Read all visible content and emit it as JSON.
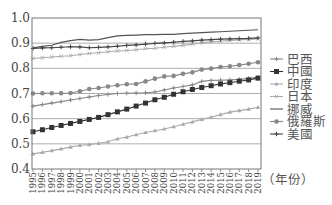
{
  "chart_data": {
    "type": "line",
    "title": "",
    "xlabel": "（年份）",
    "ylabel": "",
    "ylim": [
      0.4,
      1.0
    ],
    "yticks": [
      "0.4",
      "0.5",
      "0.6",
      "0.7",
      "0.8",
      "0.9",
      "1.0"
    ],
    "grid": "horizontal",
    "legend_position": "right",
    "x": [
      1995,
      1996,
      1997,
      1998,
      1999,
      2000,
      2001,
      2002,
      2003,
      2004,
      2005,
      2006,
      2007,
      2008,
      2009,
      2010,
      2011,
      2012,
      2013,
      2014,
      2015,
      2016,
      2017,
      2018,
      2019
    ],
    "series": [
      {
        "name": "巴西",
        "marker": "plus",
        "color": "#888888",
        "values": [
          0.65,
          0.656,
          0.662,
          0.668,
          0.674,
          0.68,
          0.686,
          0.692,
          0.696,
          0.7,
          0.701,
          0.702,
          0.703,
          0.706,
          0.714,
          0.722,
          0.728,
          0.734,
          0.748,
          0.752,
          0.753,
          0.754,
          0.756,
          0.76,
          0.765
        ]
      },
      {
        "name": "中國",
        "marker": "square",
        "color": "#333333",
        "values": [
          0.548,
          0.556,
          0.565,
          0.573,
          0.581,
          0.589,
          0.597,
          0.605,
          0.616,
          0.627,
          0.638,
          0.65,
          0.662,
          0.675,
          0.685,
          0.697,
          0.707,
          0.716,
          0.724,
          0.731,
          0.738,
          0.743,
          0.749,
          0.754,
          0.761
        ]
      },
      {
        "name": "印度",
        "marker": "triangle",
        "color": "#aaaaaa",
        "values": [
          0.46,
          0.466,
          0.473,
          0.48,
          0.487,
          0.494,
          0.497,
          0.502,
          0.508,
          0.52,
          0.527,
          0.536,
          0.545,
          0.552,
          0.559,
          0.568,
          0.578,
          0.587,
          0.597,
          0.606,
          0.616,
          0.626,
          0.632,
          0.638,
          0.645
        ]
      },
      {
        "name": "日本",
        "marker": "x",
        "color": "#aaaaaa",
        "values": [
          0.839,
          0.842,
          0.845,
          0.848,
          0.85,
          0.855,
          0.859,
          0.862,
          0.866,
          0.869,
          0.871,
          0.874,
          0.878,
          0.88,
          0.884,
          0.888,
          0.891,
          0.896,
          0.901,
          0.905,
          0.908,
          0.911,
          0.913,
          0.915,
          0.917
        ]
      },
      {
        "name": "挪威",
        "marker": "none",
        "color": "#555555",
        "values": [
          0.881,
          0.887,
          0.892,
          0.903,
          0.91,
          0.915,
          0.912,
          0.914,
          0.922,
          0.929,
          0.931,
          0.932,
          0.934,
          0.934,
          0.935,
          0.935,
          0.938,
          0.94,
          0.942,
          0.944,
          0.945,
          0.947,
          0.949,
          0.951,
          0.953
        ]
      },
      {
        "name": "俄羅斯",
        "marker": "circle",
        "color": "#888888",
        "values": [
          0.7,
          0.701,
          0.701,
          0.701,
          0.702,
          0.709,
          0.718,
          0.722,
          0.728,
          0.733,
          0.737,
          0.738,
          0.748,
          0.759,
          0.768,
          0.77,
          0.778,
          0.784,
          0.795,
          0.799,
          0.805,
          0.808,
          0.813,
          0.818,
          0.824
        ]
      },
      {
        "name": "美國",
        "marker": "plus",
        "color": "#444444",
        "values": [
          0.879,
          0.881,
          0.882,
          0.884,
          0.886,
          0.885,
          0.882,
          0.883,
          0.885,
          0.888,
          0.891,
          0.893,
          0.896,
          0.899,
          0.901,
          0.904,
          0.907,
          0.909,
          0.912,
          0.914,
          0.916,
          0.917,
          0.918,
          0.919,
          0.921
        ]
      }
    ]
  }
}
